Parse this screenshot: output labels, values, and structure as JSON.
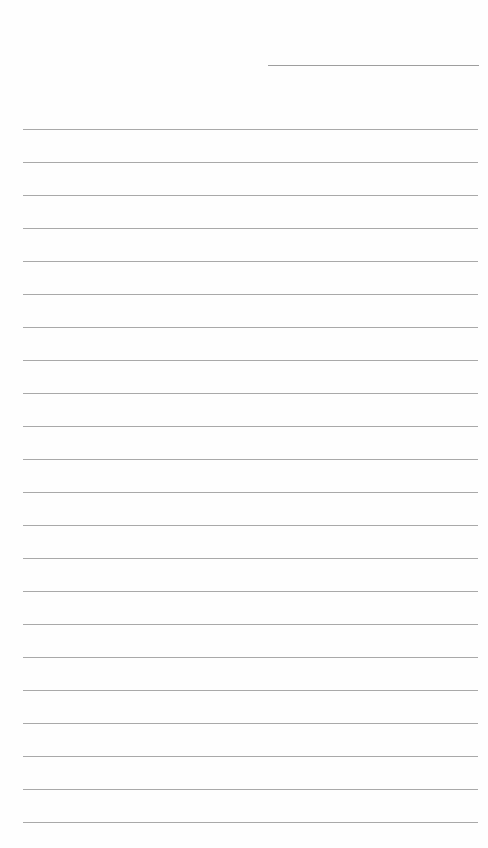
{
  "page": {
    "type": "lined-paper",
    "background_color": "#fefefe",
    "line_color": "#a9a9a9",
    "header_line": {
      "x_start": 268,
      "x_end": 479,
      "y": 65
    },
    "ruled_lines": {
      "count": 22,
      "x_start": 23,
      "x_end": 478,
      "first_y": 129,
      "spacing": 33
    },
    "text_content": []
  }
}
